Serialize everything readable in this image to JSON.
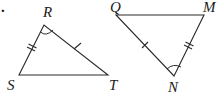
{
  "figure": {
    "bullet": ".",
    "triangle_rst": {
      "vertices": {
        "R": "R",
        "S": "S",
        "T": "T"
      },
      "marks": {
        "RS": "double-tick",
        "RT": "single-tick",
        "angle_R": "arc"
      }
    },
    "triangle_qmn": {
      "vertices": {
        "Q": "Q",
        "M": "M",
        "N": "N"
      },
      "marks": {
        "QN": "single-tick",
        "MN": "double-tick",
        "angle_N": "arc"
      }
    }
  }
}
